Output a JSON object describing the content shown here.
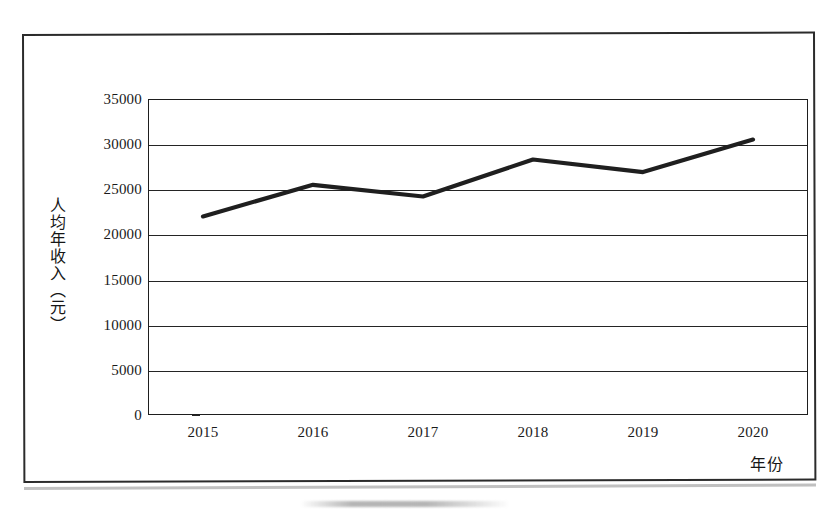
{
  "chart_data": {
    "type": "line",
    "title": "",
    "subtitle": "",
    "xlabel": "年份",
    "ylabel": "人均年收入（元）",
    "categories": [
      "2015",
      "2016",
      "2017",
      "2018",
      "2019",
      "2020"
    ],
    "values": [
      22000,
      25500,
      24200,
      28300,
      26900,
      30500
    ],
    "series": [
      {
        "name": "人均年收入",
        "values": [
          22000,
          25500,
          24200,
          28300,
          26900,
          30500
        ]
      }
    ],
    "ylim": [
      0,
      35000
    ],
    "yticks": [
      "0",
      "5000",
      "10000",
      "15000",
      "20000",
      "25000",
      "30000",
      "35000"
    ],
    "ytick_values": [
      0,
      5000,
      10000,
      15000,
      20000,
      25000,
      30000,
      35000
    ],
    "xtick_labels": [
      "2015",
      "2016",
      "2017",
      "2018",
      "2019",
      "2020"
    ],
    "grid": "horizontal",
    "legend": "none",
    "line_color": "#1f1f1f",
    "markers": "none",
    "annotations": []
  },
  "frame": {
    "border_color": "#2b2b2b",
    "background": "#ffffff"
  }
}
